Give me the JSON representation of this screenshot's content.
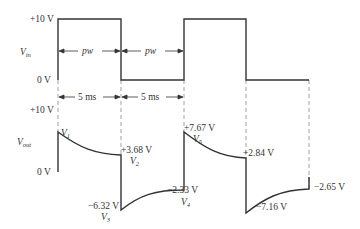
{
  "diagram": {
    "vin": {
      "label": "V",
      "label_sub": "in",
      "high_label": "+10 V",
      "low_label": "0 V",
      "pulse_width_label": "pw",
      "levels_v": [
        10,
        0
      ]
    },
    "timing": {
      "interval_label": "5 ms",
      "intervals": [
        "5 ms",
        "5 ms"
      ]
    },
    "vout": {
      "label": "V",
      "label_sub": "out",
      "top_label": "+10 V",
      "zero_label": "0 V",
      "points": [
        {
          "name": "V",
          "sub": "1",
          "value_label": ""
        },
        {
          "name": "V",
          "sub": "2",
          "value_label": "+3.68 V"
        },
        {
          "name": "V",
          "sub": "3",
          "value_label": "−6.32 V"
        },
        {
          "name": "V",
          "sub": "4",
          "value_label": "−2.33 V"
        },
        {
          "name": "V",
          "sub": "5",
          "value_label": "+7.67 V"
        },
        {
          "name": "",
          "sub": "",
          "value_label": "+2.84 V"
        },
        {
          "name": "",
          "sub": "",
          "value_label": "−7.16 V"
        },
        {
          "name": "",
          "sub": "",
          "value_label": "−2.65 V"
        }
      ]
    },
    "colors": {
      "waveform": "#333333",
      "dashed": "#777777",
      "text": "#333333"
    }
  }
}
